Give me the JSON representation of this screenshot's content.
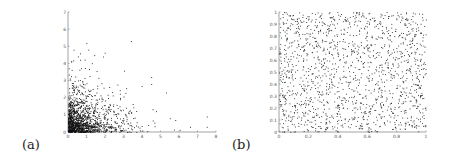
{
  "figure": {
    "panels": [
      {
        "label": "(a)"
      },
      {
        "label": "(b)"
      }
    ]
  },
  "chart_data": [
    {
      "type": "scatter",
      "panel": "(a)",
      "title": "",
      "xlabel": "",
      "ylabel": "",
      "xlim": [
        0,
        8
      ],
      "ylim": [
        0,
        7
      ],
      "xticks": [
        "0",
        "1",
        "2",
        "3",
        "4",
        "5",
        "6",
        "7",
        "8"
      ],
      "yticks": [
        "0",
        "1",
        "2",
        "3",
        "4",
        "5",
        "6",
        "7"
      ],
      "grid": false,
      "description": "Dense point cloud concentrated near origin (x<2, y<2), decaying outward; sparse outliers up to x≈7.5 and y≈5.3",
      "notable_points": [
        [
          3.4,
          5.3
        ],
        [
          1.1,
          4.8
        ],
        [
          0.3,
          4.8
        ],
        [
          1.9,
          4.4
        ],
        [
          4.5,
          3.2
        ],
        [
          4.5,
          2.8
        ],
        [
          5.3,
          2.3
        ],
        [
          7.5,
          0.9
        ],
        [
          7.5,
          0.3
        ],
        [
          6.6,
          0.3
        ],
        [
          5.5,
          0.8
        ],
        [
          5.8,
          0.7
        ]
      ],
      "n_points_approx": 1500
    },
    {
      "type": "scatter",
      "panel": "(b)",
      "title": "",
      "xlabel": "",
      "ylabel": "",
      "xlim": [
        0,
        1
      ],
      "ylim": [
        0,
        1
      ],
      "xticks": [
        "0",
        "0.2",
        "0.4",
        "0.6",
        "0.8",
        "1"
      ],
      "yticks": [
        "0",
        "0.1",
        "0.2",
        "0.3",
        "0.4",
        "0.5",
        "0.6",
        "0.7",
        "0.8",
        "0.9",
        "1"
      ],
      "grid": false,
      "description": "Points uniformly distributed over the unit square",
      "n_points_approx": 1500
    }
  ]
}
